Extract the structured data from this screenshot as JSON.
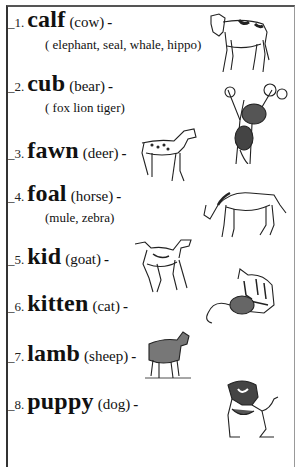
{
  "worksheet": {
    "items": [
      {
        "number": "_1.",
        "word": "calf",
        "parent": "(cow)",
        "dash": "-",
        "others": "( elephant, seal, whale, hippo)",
        "picture": "calf-drawing"
      },
      {
        "number": "_2.",
        "word": "cub",
        "parent": "(bear)",
        "dash": "-",
        "others": "( fox lion  tiger)",
        "picture": "bear-cub-in-tree-drawing"
      },
      {
        "number": "_3.",
        "word": "fawn",
        "parent": "(deer)",
        "dash": "-",
        "others": "",
        "picture": "fawn-drawing"
      },
      {
        "number": "_4.",
        "word": "foal",
        "parent": "(horse)",
        "dash": "-",
        "others": "(mule, zebra)",
        "picture": "foal-drawing"
      },
      {
        "number": "_5.",
        "word": "kid",
        "parent": "(goat)",
        "dash": "-",
        "others": "",
        "picture": "kid-goat-drawing"
      },
      {
        "number": "_6.",
        "word": "kitten",
        "parent": "(cat)",
        "dash": "-",
        "others": "",
        "picture": "kitten-with-yarn-drawing"
      },
      {
        "number": "_7.",
        "word": "lamb",
        "parent": "(sheep)",
        "dash": "-",
        "others": "",
        "picture": "lamb-drawing"
      },
      {
        "number": "_8.",
        "word": "puppy",
        "parent": "(dog)",
        "dash": "-",
        "others": "",
        "picture": "puppy-drawing"
      }
    ]
  }
}
